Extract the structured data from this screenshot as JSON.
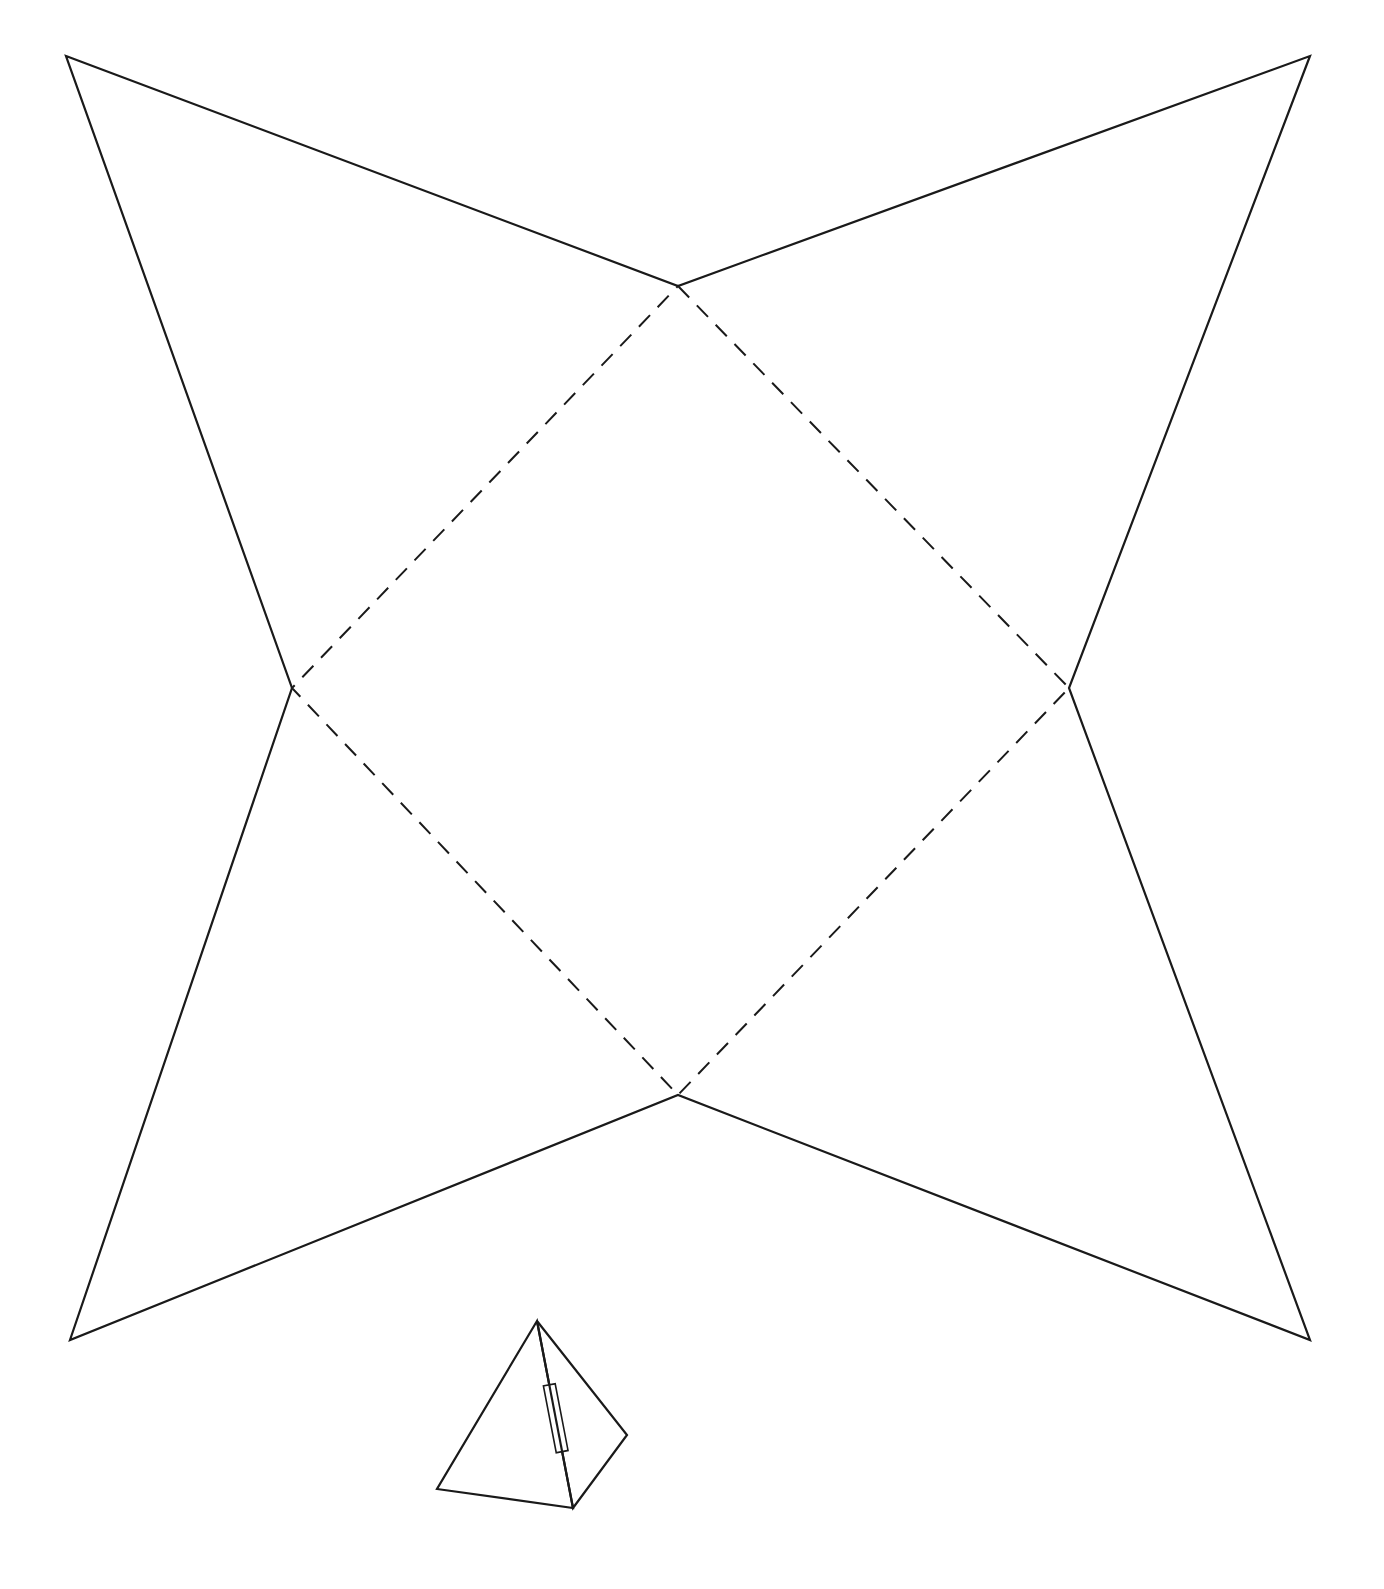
{
  "diagram": {
    "type": "square-pyramid-net",
    "colors": {
      "background": "#ffffff",
      "line": "#1a1a1a"
    },
    "base_square": {
      "line_style": "dashed",
      "vertices": {
        "top": [
          678,
          286
        ],
        "right": [
          1069,
          688
        ],
        "bottom": [
          678,
          1095
        ],
        "left": [
          292,
          688
        ]
      }
    },
    "triangular_faces": [
      {
        "name": "top-left-face",
        "apex": [
          66,
          56
        ],
        "base": [
          "left",
          "top"
        ]
      },
      {
        "name": "top-right-face",
        "apex": [
          1310,
          56
        ],
        "base": [
          "top",
          "right"
        ]
      },
      {
        "name": "bottom-right-face",
        "apex": [
          1310,
          1340
        ],
        "base": [
          "right",
          "bottom"
        ]
      },
      {
        "name": "bottom-left-face",
        "apex": [
          70,
          1340
        ],
        "base": [
          "bottom",
          "left"
        ]
      }
    ],
    "outline_style": "solid",
    "assembled_preview": {
      "apex": [
        537,
        1321
      ],
      "base_left": [
        437,
        1489
      ],
      "base_front": [
        573,
        1508
      ],
      "base_right": [
        627,
        1435
      ],
      "glue_tab": {
        "on_edge": "apex-to-base_front"
      }
    }
  }
}
